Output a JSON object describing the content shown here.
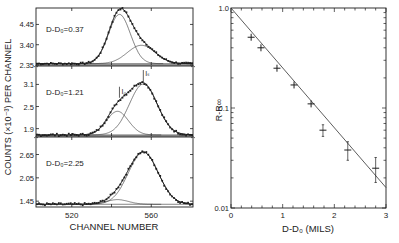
{
  "chart_data": [
    {
      "type": "line",
      "title": "",
      "xlabel": "CHANNEL NUMBER",
      "ylabel": "COUNTS (×10⁻³) PER CHANNEL",
      "xlim": [
        502,
        581
      ],
      "x_ticks": [
        520,
        560
      ],
      "panels": [
        {
          "label": "D-D₀=0.37",
          "y_ticks": [
            "4.45",
            "3.40",
            "2.35"
          ],
          "y_tick_values": [
            4.45,
            3.4,
            2.35
          ],
          "ylim": [
            2.35,
            5.3
          ],
          "baseline": 2.42,
          "peaks": [
            {
              "name": "unshifted",
              "center": 544,
              "height": 2.55,
              "width": 5.5
            },
            {
              "name": "shifted",
              "center": 555,
              "height": 0.95,
              "width": 7
            }
          ]
        },
        {
          "label": "D-D₀=1.21",
          "y_ticks": [
            "3.1",
            "2.5",
            "1.9"
          ],
          "y_tick_values": [
            3.1,
            2.5,
            1.9
          ],
          "ylim": [
            1.7,
            3.6
          ],
          "baseline": 1.73,
          "annotations": [
            "I₀",
            "Iₛ"
          ],
          "peaks": [
            {
              "name": "unshifted",
              "center": 543,
              "height": 0.64,
              "width": 5.5
            },
            {
              "name": "shifted",
              "center": 556,
              "height": 1.38,
              "width": 7
            }
          ]
        },
        {
          "label": "D-D₀=2.25",
          "y_ticks": [
            "2.65",
            "2.05",
            "1.45"
          ],
          "y_tick_values": [
            2.65,
            2.05,
            1.45
          ],
          "ylim": [
            1.3,
            3.1
          ],
          "baseline": 1.37,
          "peaks": [
            {
              "name": "unshifted",
              "center": 543,
              "height": 0.12,
              "width": 5.5
            },
            {
              "name": "shifted",
              "center": 556,
              "height": 1.34,
              "width": 7.5
            }
          ]
        }
      ]
    },
    {
      "type": "scatter",
      "title": "",
      "xlabel": "D-D₀ (MILS)",
      "ylabel": "R-R∞",
      "xlim": [
        0,
        3
      ],
      "ylim": [
        0.01,
        1.0
      ],
      "yscale": "log",
      "x_ticks": [
        "0",
        "1",
        "2",
        "3"
      ],
      "y_ticks": [
        "1.0",
        "0.1",
        "0.01"
      ],
      "points": [
        {
          "x": 0.39,
          "y": 0.51,
          "yerr": [
            0.0,
            0.0
          ]
        },
        {
          "x": 0.58,
          "y": 0.4,
          "yerr": [
            0.0,
            0.0
          ]
        },
        {
          "x": 0.89,
          "y": 0.25,
          "yerr": [
            0.0,
            0.0
          ]
        },
        {
          "x": 1.22,
          "y": 0.17,
          "yerr": [
            0.0,
            0.0
          ]
        },
        {
          "x": 1.55,
          "y": 0.11,
          "yerr": [
            0.0,
            0.0
          ]
        },
        {
          "x": 1.78,
          "y": 0.06,
          "yerr": [
            0.052,
            0.068
          ]
        },
        {
          "x": 2.26,
          "y": 0.038,
          "yerr": [
            0.03,
            0.046
          ]
        },
        {
          "x": 2.8,
          "y": 0.025,
          "yerr": [
            0.018,
            0.032
          ]
        }
      ],
      "fit_line": {
        "x": [
          0,
          3
        ],
        "y": [
          1.0,
          0.016
        ]
      }
    }
  ]
}
